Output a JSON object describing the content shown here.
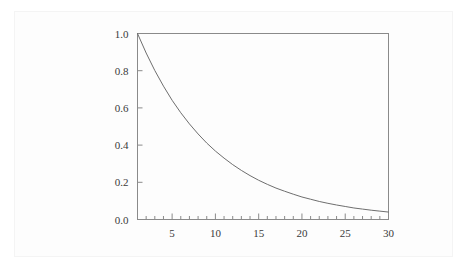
{
  "figure": {
    "background_color": "#ffffff",
    "plate_color": "#fdfdfd",
    "frame_color": "#8a8a8a",
    "curve_color": "#6e6e6e",
    "label_color": "#3a3a3a"
  },
  "chart_data": {
    "type": "line",
    "title": "",
    "subtitle": "",
    "xlabel": "",
    "ylabel": "",
    "xlim": [
      1,
      30
    ],
    "ylim": [
      0.0,
      1.0
    ],
    "grid": false,
    "legend": null,
    "legend_position": "none",
    "frame": "box",
    "x_major_ticks": [
      5,
      10,
      15,
      20,
      25,
      30
    ],
    "x_major_tick_labels": [
      "5",
      "10",
      "15",
      "20",
      "25",
      "30"
    ],
    "x_minor_tick_interval": 1,
    "y_major_ticks": [
      0.0,
      0.2,
      0.4,
      0.6,
      0.8,
      1.0
    ],
    "y_major_tick_labels": [
      "0.0",
      "0.2",
      "0.4",
      "0.6",
      "0.8",
      "1.0"
    ],
    "y_minor_tick_interval": 0,
    "series": [
      {
        "name": "decay",
        "x": [
          1,
          2,
          3,
          4,
          5,
          6,
          7,
          8,
          9,
          10,
          11,
          12,
          13,
          14,
          15,
          16,
          17,
          18,
          19,
          20,
          21,
          22,
          23,
          24,
          25,
          26,
          27,
          28,
          29,
          30
        ],
        "values": [
          1.0,
          0.895,
          0.801,
          0.717,
          0.641,
          0.574,
          0.514,
          0.46,
          0.411,
          0.368,
          0.33,
          0.295,
          0.264,
          0.236,
          0.211,
          0.189,
          0.169,
          0.152,
          0.136,
          0.121,
          0.109,
          0.097,
          0.087,
          0.078,
          0.07,
          0.062,
          0.056,
          0.05,
          0.045,
          0.04
        ]
      }
    ]
  },
  "ticks": {
    "x_labels": [
      {
        "value": 5,
        "text": "5"
      },
      {
        "value": 10,
        "text": "10"
      },
      {
        "value": 15,
        "text": "15"
      },
      {
        "value": 20,
        "text": "20"
      },
      {
        "value": 25,
        "text": "25"
      },
      {
        "value": 30,
        "text": "30"
      }
    ],
    "y_labels": [
      {
        "value": 1.0,
        "text": "1.0"
      },
      {
        "value": 0.8,
        "text": "0.8"
      },
      {
        "value": 0.6,
        "text": "0.6"
      },
      {
        "value": 0.4,
        "text": "0.4"
      },
      {
        "value": 0.2,
        "text": "0.2"
      },
      {
        "value": 0.0,
        "text": "0.0"
      }
    ]
  }
}
